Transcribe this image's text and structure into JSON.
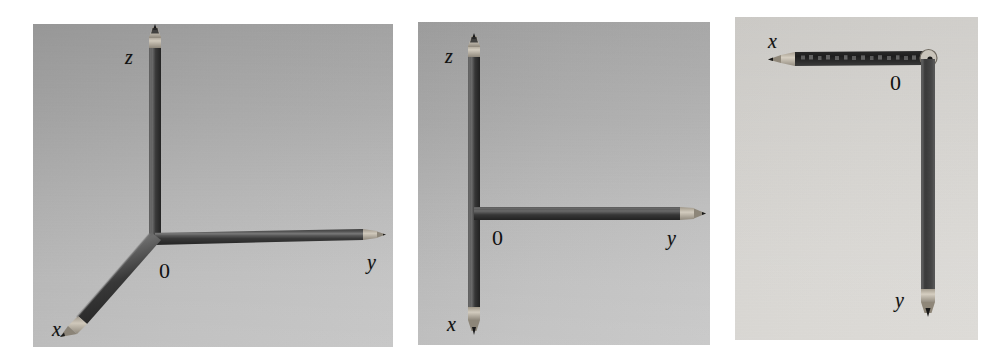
{
  "figure": {
    "title": "",
    "background_color": "#ffffff",
    "panel_count": 3
  },
  "panels": [
    {
      "id": "panel-left",
      "caption": "",
      "background_color": "#bdbdbd",
      "view": "oblique-3d",
      "labels": {
        "z": "z",
        "x": "x",
        "y": "y",
        "origin": "0"
      },
      "pencils": [
        {
          "axis": "z",
          "direction": "up",
          "tip": "sharpened"
        },
        {
          "axis": "x",
          "direction": "down-left",
          "tip": "sharpened"
        },
        {
          "axis": "y",
          "direction": "right",
          "tip": "sharpened"
        }
      ]
    },
    {
      "id": "panel-middle",
      "caption": "",
      "background_color": "#bfbfbf",
      "view": "front-yz-plane",
      "labels": {
        "z": "z",
        "x": "x",
        "y": "y",
        "origin": "0"
      },
      "pencils": [
        {
          "axis": "z",
          "direction": "up",
          "tip": "sharpened"
        },
        {
          "axis": "x",
          "direction": "down",
          "tip": "sharpened"
        },
        {
          "axis": "y",
          "direction": "right",
          "tip": "sharpened"
        }
      ]
    },
    {
      "id": "panel-right",
      "caption": "",
      "background_color": "#dbd9d5",
      "view": "top-xy-plane",
      "labels": {
        "x": "x",
        "y": "y",
        "origin": "0"
      },
      "pencils": [
        {
          "axis": "x",
          "direction": "left",
          "tip": "sharpened"
        },
        {
          "axis": "y",
          "direction": "down",
          "tip": "sharpened"
        }
      ]
    }
  ],
  "colors": {
    "pencil_body_dark": "#2e2e2e",
    "pencil_body_mid": "#474747",
    "pencil_highlight": "#6e6e6e",
    "pencil_wood": "#b9b0a2",
    "pencil_graphite": "#1a1a1a",
    "label_text": "#111111",
    "page_background": "#ffffff"
  }
}
